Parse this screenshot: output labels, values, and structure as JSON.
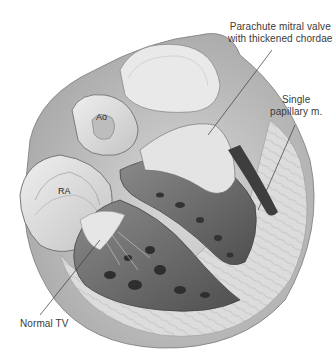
{
  "figure": {
    "labels": {
      "mitral": {
        "line1": "Parachute mitral valve",
        "line2": "with thickened chordae"
      },
      "papillary": {
        "line1": "Single",
        "line2": "papillary m."
      },
      "aorta": "Ao",
      "right_atrium": "RA",
      "tricuspid": "Normal TV"
    },
    "colors": {
      "ink": "#3a3a3a",
      "background": "#ffffff",
      "tissue_light": "#e6e6e6",
      "tissue_mid": "#bdbdbd",
      "tissue_dark": "#5a5a5a"
    }
  }
}
